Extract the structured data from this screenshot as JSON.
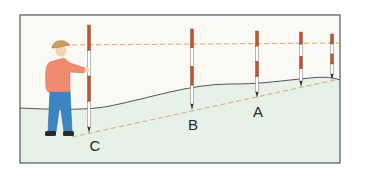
{
  "diagram": {
    "title": "",
    "labels": {
      "c": "C",
      "b": "B",
      "a": "A"
    },
    "colors": {
      "sky": "#fbf9f3",
      "ground": "#e6f1e7",
      "ground_line": "#4a5a50",
      "frame": "#555555",
      "sight_line": "#e8a070",
      "rod_red": "#c8502a",
      "rod_white": "#ffffff",
      "shirt": "#f08a70",
      "jeans": "#3a86c4",
      "hat": "#c9a15a",
      "skin": "#f5d2b0",
      "boots": "#2a2a2a"
    },
    "elements": {
      "person": "surveyor holding ranging rod",
      "rods": [
        "rod-c",
        "rod-b",
        "rod-a",
        "rod-4",
        "rod-5"
      ],
      "lines": [
        "upper-sight-line",
        "lower-slope-line",
        "ground-profile"
      ]
    }
  }
}
